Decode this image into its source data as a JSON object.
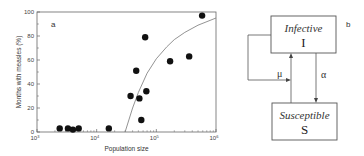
{
  "chart_data": {
    "type": "scatter",
    "panel_label": "a",
    "xlabel": "Population size",
    "ylabel": "Months with measles (%)",
    "xscale": "log",
    "xlim": [
      1000,
      1000000
    ],
    "ylim": [
      0,
      100
    ],
    "xticks": [
      {
        "base": "10",
        "exp": "3"
      },
      {
        "base": "10",
        "exp": "4"
      },
      {
        "base": "10",
        "exp": "5"
      },
      {
        "base": "10",
        "exp": "6"
      }
    ],
    "yticks": [
      "0",
      "20",
      "40",
      "60",
      "80",
      "100"
    ],
    "grid": false,
    "legend": null,
    "points": [
      {
        "x": 2400,
        "y": 3
      },
      {
        "x": 3300,
        "y": 3
      },
      {
        "x": 4000,
        "y": 2
      },
      {
        "x": 5000,
        "y": 3
      },
      {
        "x": 16000,
        "y": 3
      },
      {
        "x": 37000,
        "y": 30
      },
      {
        "x": 46000,
        "y": 51
      },
      {
        "x": 52000,
        "y": 28
      },
      {
        "x": 56000,
        "y": 10
      },
      {
        "x": 65000,
        "y": 79
      },
      {
        "x": 68000,
        "y": 34
      },
      {
        "x": 170000,
        "y": 59
      },
      {
        "x": 355000,
        "y": 63
      },
      {
        "x": 585000,
        "y": 97
      }
    ],
    "fit_curve": {
      "description": "model curve rising from 0 at ~30000 to ~97 at 10^6",
      "x": [
        30000,
        40000,
        50000,
        70000,
        100000,
        150000,
        200000,
        300000,
        500000,
        1000000
      ],
      "y": [
        0,
        20,
        33,
        49,
        61,
        71,
        77,
        83,
        89,
        95
      ]
    }
  },
  "diagram": {
    "panel_label": "b",
    "infective": {
      "title": "Infective",
      "symbol": "I"
    },
    "susceptible": {
      "title": "Susceptible",
      "symbol": "S"
    },
    "mu_label": "μ",
    "alpha_label": "α"
  }
}
